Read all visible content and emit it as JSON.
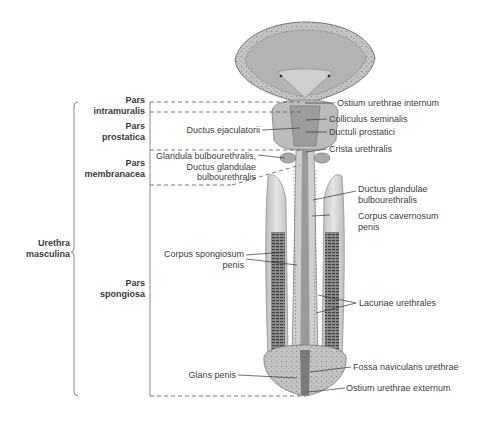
{
  "figure": {
    "group_label": {
      "line1": "Urethra",
      "line2": "masculina"
    },
    "sections": [
      {
        "line1": "Pars",
        "line2": "intramuralis"
      },
      {
        "line1": "Pars",
        "line2": "prostatica"
      },
      {
        "line1": "Pars",
        "line2": "membranacea"
      },
      {
        "line1": "Pars",
        "line2": "spongiosa"
      }
    ],
    "labels_left": [
      {
        "line1": "Ductus ejaculatorii"
      },
      {
        "line1": "Glandula bulbourethralis,",
        "line2": "Ductus glandulae",
        "line3": "bulbourethralis"
      },
      {
        "line1": "Corpus spongiosum",
        "line2": "penis"
      },
      {
        "line1": "Glans penis"
      }
    ],
    "labels_right": [
      {
        "line1": "Ostium urethrae internum"
      },
      {
        "line1": "Colliculus seminalis"
      },
      {
        "line1": "Ductuli prostatici"
      },
      {
        "line1": "Crista urethralis"
      },
      {
        "line1": "Ductus glandulae",
        "line2": "bulbourethralis"
      },
      {
        "line1": "Corpus cavernosum",
        "line2": "penis"
      },
      {
        "line1": "Lacunae urethrales"
      },
      {
        "line1": "Fossa navicularis urethrae"
      },
      {
        "line1": "Ostium urethrae externum"
      }
    ]
  },
  "colors": {
    "tissue_light": "#d9d9d9",
    "tissue_mid": "#a8a8a8",
    "tissue_dark": "#5a5a5a",
    "line": "#333333",
    "bracket": "#8a8a8a"
  }
}
